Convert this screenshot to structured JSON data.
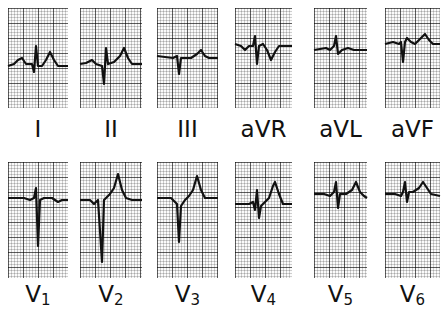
{
  "figure": {
    "rows": [
      {
        "name": "limb-leads",
        "leads": [
          {
            "id": "I",
            "label": "I",
            "sub": "",
            "box": [
              8,
              8,
              60,
              100
            ],
            "labelY": 118,
            "path": "M0,58 L6,56 L10,52 L14,50 L18,56 L24,56 L26,64 L28,38 L30,58 L34,58 L38,52 L42,44 L46,52 L50,58 L60,58"
          },
          {
            "id": "II",
            "label": "II",
            "sub": "",
            "box": [
              80,
              8,
              62,
              100
            ],
            "labelY": 118,
            "path": "M0,56 L6,55 L12,52 L16,56 L22,58 L24,76 L26,40 L28,56 L34,54 L40,48 L44,40 L48,50 L52,56 L62,56"
          },
          {
            "id": "III",
            "label": "III",
            "sub": "",
            "box": [
              157,
              8,
              61,
              100
            ],
            "labelY": 118,
            "path": "M0,48 L16,50 L20,48 L22,66 L24,50 L34,50 L40,46 L44,42 L48,48 L52,50 L61,50"
          },
          {
            "id": "aVR",
            "label": "aVR",
            "sub": "",
            "box": [
              235,
              8,
              57,
              100
            ],
            "labelY": 118,
            "path": "M0,36 L6,38 L10,42 L14,38 L18,38 L20,28 L22,56 L24,38 L28,36 L32,42 L36,52 L40,44 L44,38 L57,38"
          },
          {
            "id": "aVL",
            "label": "aVL",
            "sub": "",
            "box": [
              314,
              8,
              53,
              100
            ],
            "labelY": 118,
            "path": "M0,42 L12,40 L16,42 L20,38 L22,28 L24,46 L28,42 L34,40 L40,42 L46,42 L53,42"
          },
          {
            "id": "aVF",
            "label": "aVF",
            "sub": "",
            "box": [
              385,
              8,
              55,
              100
            ],
            "labelY": 118,
            "path": "M0,36 L8,34 L14,36 L16,34 L18,54 L20,34 L22,30 L26,34 L30,36 L36,30 L40,26 L44,32 L48,36 L55,36"
          }
        ]
      },
      {
        "name": "precordial-leads",
        "leads": [
          {
            "id": "V1",
            "label": "V",
            "sub": "1",
            "box": [
              8,
              162,
              60,
              116
            ],
            "labelY": 283,
            "path": "M0,36 L16,36 L22,38 L26,36 L28,26 L30,84 L32,38 L36,36 L44,36 L50,40 L54,38 L60,38"
          },
          {
            "id": "V2",
            "label": "V",
            "sub": "2",
            "box": [
              80,
              162,
              62,
              116
            ],
            "labelY": 283,
            "path": "M0,38 L10,38 L14,42 L18,38 L22,100 L24,38 L30,32 L34,26 L38,12 L42,28 L46,36 L52,38 L62,38"
          },
          {
            "id": "V3",
            "label": "V",
            "sub": "3",
            "box": [
              157,
              162,
              61,
              116
            ],
            "labelY": 283,
            "path": "M0,36 L14,36 L18,40 L20,42 L22,80 L24,44 L28,38 L32,34 L36,28 L40,14 L44,28 L48,36 L54,36 L61,36"
          },
          {
            "id": "V4",
            "label": "V",
            "sub": "4",
            "box": [
              235,
              162,
              57,
              116
            ],
            "labelY": 283,
            "path": "M0,42 L14,42 L18,40 L20,48 L22,28 L24,56 L26,44 L30,40 L34,36 L38,24 L40,20 L44,32 L48,42 L57,42"
          },
          {
            "id": "V5",
            "label": "V",
            "sub": "5",
            "box": [
              314,
              162,
              53,
              116
            ],
            "labelY": 283,
            "path": "M0,32 L10,32 L16,34 L20,30 L22,20 L24,46 L26,32 L32,32 L38,28 L42,20 L46,30 L50,34 L53,36"
          },
          {
            "id": "V6",
            "label": "V",
            "sub": "6",
            "box": [
              385,
              162,
              55,
              116
            ],
            "labelY": 283,
            "path": "M0,32 L10,32 L16,34 L18,30 L20,20 L22,40 L24,30 L28,30 L34,26 L38,20 L42,26 L46,32 L55,34"
          }
        ]
      }
    ],
    "colors": {
      "trace": "#111111",
      "label": "#111111",
      "paper": "#fbfbfb",
      "grid": "#000000"
    }
  }
}
